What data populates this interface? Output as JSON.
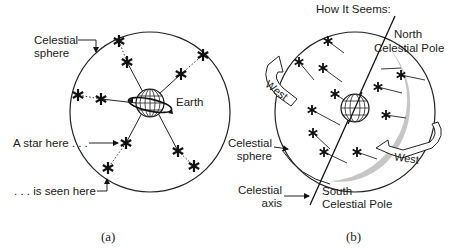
{
  "panel_a": {
    "caption": "(a)",
    "labels": {
      "celestial_sphere_1": "Celestial",
      "celestial_sphere_2": "sphere",
      "earth": "Earth",
      "star_here": "A star here . . .",
      "seen_here": ". . . is seen here"
    }
  },
  "panel_b": {
    "caption": "(b)",
    "title": "How It Seems:",
    "labels": {
      "north_pole_1": "North",
      "north_pole_2": "Celestial Pole",
      "celestial_sphere_1": "Celestial",
      "celestial_sphere_2": "sphere",
      "celestial_axis_1": "Celestial",
      "celestial_axis_2": "axis",
      "south_pole_1": "South",
      "south_pole_2": "Celestial Pole",
      "west_left": "West",
      "west_right": "West"
    }
  },
  "colors": {
    "line": "#1a1a1a",
    "shade": "#c8c8c8"
  }
}
